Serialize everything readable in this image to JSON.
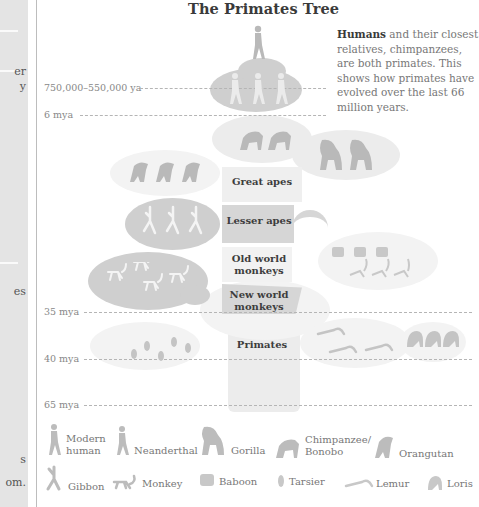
{
  "left_panel": {
    "fragments": [
      {
        "text": "er",
        "top": 65
      },
      {
        "text": "y",
        "top": 80
      },
      {
        "text": "es",
        "top": 285
      },
      {
        "text": "s",
        "top": 453
      },
      {
        "text": "om.",
        "top": 476
      }
    ]
  },
  "diagram": {
    "title": "The Primates Tree",
    "intro_bold": "Humans",
    "intro_rest": " and their closest relatives, chimpanzees, are both primates. This shows how primates have evolved over the last 66 million years.",
    "timeline": [
      {
        "label": "750,000–550,000 ya",
        "y": 88
      },
      {
        "label": "6 mya",
        "y": 115
      },
      {
        "label": "35 mya",
        "y": 312
      },
      {
        "label": "40 mya",
        "y": 359
      },
      {
        "label": "65 mya",
        "y": 405
      }
    ],
    "groups": {
      "great_apes": "Great apes",
      "lesser_apes": "Lesser apes",
      "old_world_monkeys": "Old world monkeys",
      "new_world_monkeys": "New world monkeys",
      "primates": "Primates"
    },
    "fill_colors": {
      "dark": "#cfcfcf",
      "mid": "#dcdcdc",
      "light": "#ececec",
      "silhouette": "#b9b9b9"
    }
  },
  "legend": {
    "items": [
      {
        "icon": "modern-human-icon",
        "label": "Modern human"
      },
      {
        "icon": "neanderthal-icon",
        "label": "Neanderthal"
      },
      {
        "icon": "gorilla-icon",
        "label": "Gorilla"
      },
      {
        "icon": "chimpanzee-icon",
        "label": "Chimpanzee/ Bonobo"
      },
      {
        "icon": "orangutan-icon",
        "label": "Orangutan"
      },
      {
        "icon": "gibbon-icon",
        "label": "Gibbon"
      },
      {
        "icon": "monkey-icon",
        "label": "Monkey"
      },
      {
        "icon": "baboon-icon",
        "label": "Baboon"
      },
      {
        "icon": "tarsier-icon",
        "label": "Tarsier"
      },
      {
        "icon": "lemur-icon",
        "label": "Lemur"
      },
      {
        "icon": "loris-icon",
        "label": "Loris"
      }
    ]
  }
}
